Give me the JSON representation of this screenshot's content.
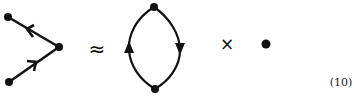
{
  "diagram": {
    "colors": {
      "ink": "#111111",
      "background": "#ffffff"
    },
    "lhs": {
      "description": "Vertex with two incoming/outgoing propagator lines",
      "nodes": [
        {
          "id": "top-left",
          "x": 8,
          "y": 17
        },
        {
          "id": "vertex",
          "x": 59,
          "y": 47
        },
        {
          "id": "bottom-left",
          "x": 9,
          "y": 82
        }
      ],
      "edges": [
        {
          "from": "vertex",
          "to": "top-left",
          "arrow": "toward top-left"
        },
        {
          "from": "bottom-left",
          "to": "vertex",
          "arrow": "toward vertex"
        }
      ]
    },
    "approx_symbol": "≈",
    "loop": {
      "description": "Closed fermion loop with two vertices",
      "nodes": [
        {
          "id": "loop-top",
          "x": 154,
          "y": 7
        },
        {
          "id": "loop-bottom",
          "x": 155,
          "y": 89
        }
      ],
      "arrows": [
        {
          "side": "left",
          "direction": "up"
        },
        {
          "side": "right",
          "direction": "down"
        }
      ]
    },
    "times_symbol": "×",
    "dot": {
      "x": 266,
      "y": 44
    },
    "equation_number": "(10)"
  }
}
